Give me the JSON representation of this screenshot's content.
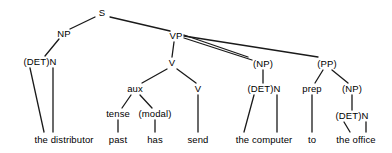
{
  "diagram": {
    "type": "constituency-tree",
    "sentence": "the distributor past has send the computer to the office",
    "canvas": {
      "width": 392,
      "height": 153
    },
    "style": {
      "line_color": "#1a1a1a",
      "text_color": "#000000",
      "background": "#ffffff",
      "line_width": 1.3
    },
    "nodes": [
      {
        "id": "S",
        "label": "S",
        "x": 102,
        "y": 13,
        "kind": "nonterminal"
      },
      {
        "id": "NP1",
        "label": "NP",
        "x": 64,
        "y": 34,
        "kind": "nonterminal"
      },
      {
        "id": "VP",
        "label": "VP",
        "x": 176,
        "y": 36,
        "kind": "nonterminal"
      },
      {
        "id": "DETN1",
        "label": "(DET)N",
        "x": 40,
        "y": 62,
        "kind": "nonterminal"
      },
      {
        "id": "V1",
        "label": "V",
        "x": 172,
        "y": 63,
        "kind": "nonterminal"
      },
      {
        "id": "NP2",
        "label": "(NP)",
        "x": 263,
        "y": 64,
        "kind": "nonterminal"
      },
      {
        "id": "PP",
        "label": "(PP)",
        "x": 327,
        "y": 64,
        "kind": "nonterminal"
      },
      {
        "id": "AUX",
        "label": "aux",
        "x": 135,
        "y": 89,
        "kind": "nonterminal"
      },
      {
        "id": "V2",
        "label": "V",
        "x": 198,
        "y": 89,
        "kind": "nonterminal"
      },
      {
        "id": "DETN2",
        "label": "(DET)N",
        "x": 264,
        "y": 89,
        "kind": "nonterminal"
      },
      {
        "id": "PREP",
        "label": "prep",
        "x": 312,
        "y": 89,
        "kind": "nonterminal"
      },
      {
        "id": "NP3",
        "label": "(NP)",
        "x": 352,
        "y": 89,
        "kind": "nonterminal"
      },
      {
        "id": "TENSE",
        "label": "tense",
        "x": 118,
        "y": 114,
        "kind": "nonterminal"
      },
      {
        "id": "MODAL",
        "label": "(modal)",
        "x": 155,
        "y": 114,
        "kind": "nonterminal"
      },
      {
        "id": "DETN3",
        "label": "(DET)N",
        "x": 352,
        "y": 116,
        "kind": "nonterminal"
      },
      {
        "id": "W_THEDIST",
        "label": "the distributor",
        "x": 64,
        "y": 140,
        "kind": "terminal"
      },
      {
        "id": "W_PAST",
        "label": "past",
        "x": 118,
        "y": 140,
        "kind": "terminal"
      },
      {
        "id": "W_HAS",
        "label": "has",
        "x": 155,
        "y": 140,
        "kind": "terminal"
      },
      {
        "id": "W_SEND",
        "label": "send",
        "x": 198,
        "y": 140,
        "kind": "terminal"
      },
      {
        "id": "W_THECOMP",
        "label": "the computer",
        "x": 264,
        "y": 140,
        "kind": "terminal"
      },
      {
        "id": "W_TO",
        "label": "to",
        "x": 312,
        "y": 140,
        "kind": "terminal"
      },
      {
        "id": "W_THEOFF",
        "label": "the office",
        "x": 356,
        "y": 140,
        "kind": "terminal"
      }
    ],
    "edges": [
      {
        "from": "S",
        "to": "NP1",
        "x1": 95,
        "y1": 17,
        "x2": 70,
        "y2": 29
      },
      {
        "from": "S",
        "to": "VP",
        "x1": 110,
        "y1": 17,
        "x2": 170,
        "y2": 31
      },
      {
        "from": "NP1",
        "to": "DETN1",
        "x1": 59,
        "y1": 39,
        "x2": 45,
        "y2": 56
      },
      {
        "from": "DETN1",
        "to": "W_THEDIST_DET",
        "x1": 30,
        "y1": 68,
        "x2": 44,
        "y2": 132
      },
      {
        "from": "DETN1",
        "to": "W_THEDIST_N",
        "x1": 53,
        "y1": 68,
        "x2": 53,
        "y2": 132
      },
      {
        "from": "VP",
        "to": "V1",
        "x1": 174,
        "y1": 42,
        "x2": 172,
        "y2": 57
      },
      {
        "from": "VP",
        "to": "NP2",
        "x1": 184,
        "y1": 35,
        "x2": 248,
        "y2": 57
      },
      {
        "from": "VP",
        "to": "NP2_b",
        "x1": 184,
        "y1": 38,
        "x2": 252,
        "y2": 60
      },
      {
        "from": "VP",
        "to": "PP",
        "x1": 184,
        "y1": 36,
        "x2": 318,
        "y2": 57
      },
      {
        "from": "V1",
        "to": "AUX",
        "x1": 167,
        "y1": 69,
        "x2": 142,
        "y2": 83
      },
      {
        "from": "V1",
        "to": "V2",
        "x1": 177,
        "y1": 69,
        "x2": 196,
        "y2": 83
      },
      {
        "from": "AUX",
        "to": "TENSE",
        "x1": 131,
        "y1": 95,
        "x2": 122,
        "y2": 108
      },
      {
        "from": "AUX",
        "to": "MODAL",
        "x1": 140,
        "y1": 95,
        "x2": 152,
        "y2": 108
      },
      {
        "from": "TENSE",
        "to": "W_PAST",
        "x1": 118,
        "y1": 120,
        "x2": 118,
        "y2": 132
      },
      {
        "from": "MODAL",
        "to": "W_HAS",
        "x1": 155,
        "y1": 120,
        "x2": 155,
        "y2": 132
      },
      {
        "from": "V2",
        "to": "W_SEND",
        "x1": 198,
        "y1": 95,
        "x2": 198,
        "y2": 132
      },
      {
        "from": "NP2",
        "to": "DETN2",
        "x1": 263,
        "y1": 70,
        "x2": 263,
        "y2": 83
      },
      {
        "from": "DETN2",
        "to": "W_THECOMP_DET",
        "x1": 254,
        "y1": 95,
        "x2": 244,
        "y2": 132
      },
      {
        "from": "DETN2",
        "to": "W_THECOMP_N",
        "x1": 277,
        "y1": 95,
        "x2": 277,
        "y2": 132
      },
      {
        "from": "PP",
        "to": "PREP",
        "x1": 323,
        "y1": 70,
        "x2": 315,
        "y2": 83
      },
      {
        "from": "PP",
        "to": "NP3",
        "x1": 332,
        "y1": 70,
        "x2": 348,
        "y2": 83
      },
      {
        "from": "PREP",
        "to": "W_TO",
        "x1": 312,
        "y1": 95,
        "x2": 312,
        "y2": 132
      },
      {
        "from": "NP3",
        "to": "DETN3",
        "x1": 352,
        "y1": 95,
        "x2": 352,
        "y2": 110
      },
      {
        "from": "DETN3",
        "to": "W_THEOFF_DET",
        "x1": 344,
        "y1": 122,
        "x2": 350,
        "y2": 132
      },
      {
        "from": "DETN3",
        "to": "W_THEOFF_N",
        "x1": 366,
        "y1": 122,
        "x2": 366,
        "y2": 132
      }
    ]
  }
}
